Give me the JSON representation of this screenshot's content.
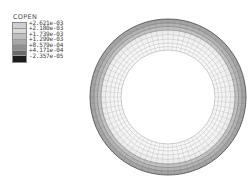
{
  "legend": {
    "title": "COPEN",
    "entries": [
      {
        "value": "+2.621e-03",
        "color": "#cfcfcf"
      },
      {
        "value": "+2.180e-03",
        "color": "#d8d8d8"
      },
      {
        "value": "+1.739e-03",
        "color": "#bfbfbf"
      },
      {
        "value": "+1.299e-03",
        "color": "#a8a8a8"
      },
      {
        "value": "+8.579e-04",
        "color": "#8e8e8e"
      },
      {
        "value": "+4.171e-04",
        "color": "#6a6a6a"
      },
      {
        "value": "-2.357e-05",
        "color": "#1c1c1c"
      }
    ]
  },
  "mesh": {
    "name": "annular-contact-mesh",
    "center_x": 80,
    "center_y": 81,
    "outer_radius": 78,
    "inner_radius": 47,
    "radial_divisions": 72,
    "ring_radii": [
      47,
      50.5,
      54,
      58,
      62.5,
      67,
      70.5,
      74,
      78
    ],
    "ring_colors": [
      "#d5d5d5",
      "#d9d9d9",
      "#dcdcdc",
      "#d2d2d2",
      "#c2c2c2",
      "#a9a9a9",
      "#8f8f8f",
      "#757575",
      "#5a5a5a"
    ],
    "spoke_color": "#c8c8c8",
    "outer_band_count": 3
  },
  "chart_data": {
    "type": "contour",
    "title": "COPEN",
    "quantity": "COPEN",
    "colorbar_labels": [
      "+2.621e-03",
      "+2.180e-03",
      "+1.739e-03",
      "+1.299e-03",
      "+8.579e-04",
      "+4.171e-04",
      "-2.357e-05"
    ],
    "colorbar_values": [
      0.002621,
      0.00218,
      0.001739,
      0.001299,
      0.0008579,
      0.0004171,
      -2.357e-05
    ],
    "colorbar_colors": [
      "#cfcfcf",
      "#d8d8d8",
      "#bfbfbf",
      "#a8a8a8",
      "#8e8e8e",
      "#6a6a6a",
      "#1c1c1c"
    ],
    "vmin": -2.357e-05,
    "vmax": 0.002621,
    "geometry": "annulus",
    "legend_position": "top-left",
    "grid": false,
    "xlabel": "",
    "ylabel": ""
  }
}
